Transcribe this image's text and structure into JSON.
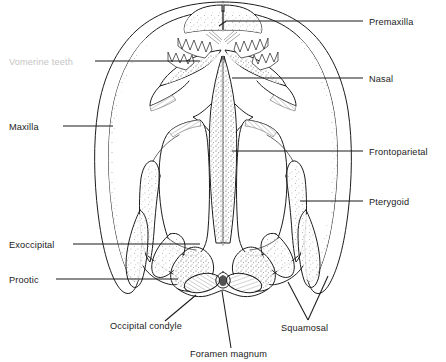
{
  "figure": {
    "view": "dorsal",
    "background_color": "#ffffff",
    "line_color": "#1c1c1c",
    "label_color": "#222222",
    "faded_label_color": "#c4c4c4",
    "width": 446,
    "height": 362
  },
  "labels": [
    {
      "id": "premaxilla",
      "text": "Premaxilla",
      "side": "right",
      "text_x": 369,
      "text_y": 25,
      "anchor": "start",
      "faded": false,
      "leader": "M363,21 L226,21 L219,26",
      "target": "snout-tip"
    },
    {
      "id": "nasal",
      "text": "Nasal",
      "side": "right",
      "text_x": 369,
      "text_y": 82,
      "anchor": "start",
      "faded": false,
      "leader": "M363,78 L232,78",
      "target": "nasal-bone"
    },
    {
      "id": "frontoparietal",
      "text": "Frontoparietal",
      "side": "right",
      "text_x": 369,
      "text_y": 155,
      "anchor": "start",
      "faded": false,
      "leader": "M363,151 L232,151",
      "target": "frontoparietal-bone"
    },
    {
      "id": "pterygoid",
      "text": "Pterygoid",
      "side": "right",
      "text_x": 369,
      "text_y": 205,
      "anchor": "start",
      "faded": false,
      "leader": "M363,201 L300,201",
      "target": "pterygoid-bone"
    },
    {
      "id": "vomerine-teeth",
      "text": "Vomerine teeth",
      "side": "left",
      "text_x": 9,
      "text_y": 65,
      "anchor": "start",
      "faded": true,
      "leader": "M95,61 L200,61",
      "target": "vomerine-teeth-cluster"
    },
    {
      "id": "maxilla",
      "text": "Maxilla",
      "side": "left",
      "text_x": 9,
      "text_y": 130,
      "anchor": "start",
      "faded": false,
      "leader": "M63,126 L113,126",
      "target": "maxilla-bone"
    },
    {
      "id": "exoccipital",
      "text": "Exoccipital",
      "side": "left",
      "text_x": 9,
      "text_y": 248,
      "anchor": "start",
      "faded": false,
      "leader": "M73,244 L200,244",
      "target": "exoccipital-bone"
    },
    {
      "id": "prootic",
      "text": "Prootic",
      "side": "left",
      "text_x": 9,
      "text_y": 283,
      "anchor": "start",
      "faded": false,
      "leader": "M56,279 L178,279",
      "target": "prootic-bone"
    },
    {
      "id": "occipital-condyle",
      "text": "Occipital condyle",
      "side": "bottom",
      "text_x": 110,
      "text_y": 329,
      "anchor": "start",
      "faded": false,
      "leader": "M165,321 L196,295",
      "target": "occipital-condyle-structure"
    },
    {
      "id": "foramen-magnum",
      "text": "Foramen magnum",
      "side": "bottom",
      "text_x": 190,
      "text_y": 357,
      "anchor": "start",
      "faded": false,
      "leader": "M231,348 L222,291",
      "target": "foramen-magnum-opening"
    },
    {
      "id": "squamosal",
      "text": "Squamosal",
      "side": "bottom",
      "text_x": 281,
      "text_y": 331,
      "anchor": "start",
      "faded": false,
      "leader": "M308,320 L288,282 M308,320 L328,276",
      "target": "squamosal-bone"
    }
  ]
}
